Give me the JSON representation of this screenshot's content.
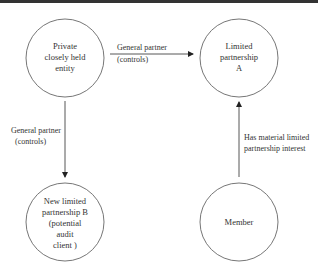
{
  "diagram": {
    "nodes": [
      {
        "id": "private_entity",
        "lines": [
          "Private",
          "closely held",
          "entity"
        ]
      },
      {
        "id": "lp_a",
        "lines": [
          "Limited",
          "partnership",
          "A"
        ]
      },
      {
        "id": "lp_b",
        "lines": [
          "New limited",
          "partnership B",
          "(potential",
          "audit",
          "client )"
        ]
      },
      {
        "id": "member",
        "lines": [
          "Member"
        ]
      }
    ],
    "edges": [
      {
        "from": "private_entity",
        "to": "lp_a",
        "lines": [
          "General partner",
          "(controls)"
        ]
      },
      {
        "from": "private_entity",
        "to": "lp_b",
        "lines": [
          "General partner",
          "(controls)"
        ]
      },
      {
        "from": "member",
        "to": "lp_a",
        "lines": [
          "Has material limited",
          "partnership interest"
        ]
      }
    ]
  },
  "colors": {
    "stroke": "#555555",
    "arrow": "#222222",
    "text": "#333333",
    "border": "#333333"
  }
}
